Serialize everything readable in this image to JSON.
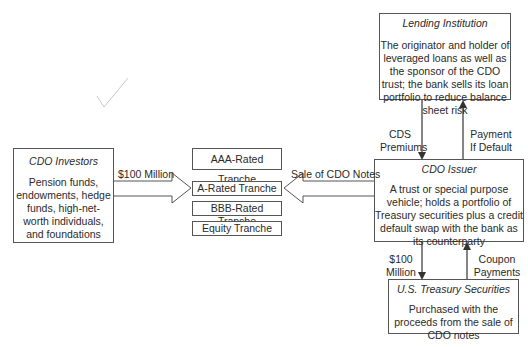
{
  "nodes": {
    "lending_institution": {
      "title": "Lending Institution",
      "description": "The originator and holder of leveraged loans as well as the sponsor of the CDO trust; the bank sells its loan portfolio to reduce balance sheet risk"
    },
    "cdo_issuer": {
      "title": "CDO Issuer",
      "description": "A trust or special purpose vehicle; holds a portfolio of Treasury securities plus a credit default swap with the bank as its counterparty"
    },
    "treasury": {
      "title": "U.S. Treasury Securities",
      "description": "Purchased with the proceeds from the sale of CDO notes"
    },
    "cdo_investors": {
      "title": "CDO Investors",
      "description": "Pension funds, endowments, hedge funds, high-net-worth individuals, and foundations"
    }
  },
  "tranches": [
    {
      "label": "AAA-Rated Tranche"
    },
    {
      "label": "A-Rated Tranche"
    },
    {
      "label": "BBB-Rated Tranche"
    },
    {
      "label": "Equity Tranche"
    }
  ],
  "edges": {
    "investors_to_tranches": "$100 Million",
    "issuer_to_tranches": "Sale of CDO Notes",
    "cds_premiums_line1": "CDS",
    "cds_premiums_line2": "Premiums",
    "payment_default_line1": "Payment",
    "payment_default_line2": "If Default",
    "issuer_to_treasury_line1": "$100",
    "issuer_to_treasury_line2": "Million",
    "coupon_line1": "Coupon",
    "coupon_line2": "Payments"
  },
  "caption": "Exhibit: Synthetic CDO structure"
}
